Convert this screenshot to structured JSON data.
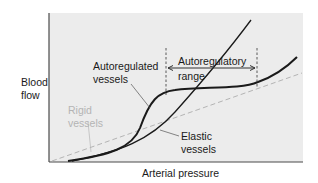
{
  "figure": {
    "y_axis_label_line1": "Blood",
    "y_axis_label_line2": "flow",
    "x_axis_label": "Arterial pressure",
    "annotations": {
      "autoregulated_line1": "Autoregulated",
      "autoregulated_line2": "vessels",
      "range_line1": "Autoregulatory",
      "range_line2": "range",
      "rigid_line1": "Rigid",
      "rigid_line2": "vessels",
      "elastic_line1": "Elastic",
      "elastic_line2": "vessels"
    },
    "colors": {
      "panel_background": "#ececec",
      "curve_dark": "#1a1a1a",
      "rigid_dashed": "#b4b4b4",
      "elastic_line": "#1a1a1a",
      "label_gray": "#b4b4b4"
    },
    "series": [
      {
        "name": "Autoregulated vessels",
        "style": "solid-thick-black",
        "shape": "sigmoid with plateau across autoregulatory range"
      },
      {
        "name": "Elastic vessels",
        "style": "solid-black",
        "shape": "convex, rising steeply"
      },
      {
        "name": "Rigid vessels",
        "style": "dashed-gray",
        "shape": "straight line"
      }
    ]
  }
}
